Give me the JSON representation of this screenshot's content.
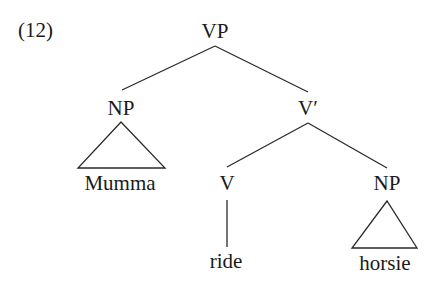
{
  "example_number": "(12)",
  "tree": {
    "nodes": {
      "vp": {
        "label": "VP"
      },
      "np_subject": {
        "label": "NP"
      },
      "v_bar": {
        "label": "V′"
      },
      "v": {
        "label": "V"
      },
      "np_object": {
        "label": "NP"
      }
    },
    "leaves": {
      "subject": {
        "text": "Mumma"
      },
      "verb": {
        "text": "ride"
      },
      "object": {
        "text": "horsie"
      }
    }
  },
  "colors": {
    "line": "#2a2a2a",
    "text": "#1a1a1a",
    "background": "#ffffff"
  }
}
